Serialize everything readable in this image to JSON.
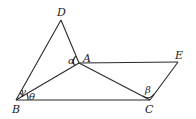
{
  "diagram": {
    "type": "geometry",
    "points": {
      "D": {
        "label": "D",
        "x": 61,
        "y": 20
      },
      "A": {
        "label": "A",
        "x": 79,
        "y": 63
      },
      "E": {
        "label": "E",
        "x": 178,
        "y": 62
      },
      "B": {
        "label": "B",
        "x": 16,
        "y": 100
      },
      "C": {
        "label": "C",
        "x": 150,
        "y": 100
      }
    },
    "segments": [
      "BD",
      "DA",
      "BA",
      "AC",
      "AE",
      "EC",
      "BC"
    ],
    "angles": {
      "alpha": {
        "label": "α",
        "vertex": "A"
      },
      "beta": {
        "label": "β",
        "vertex": "C"
      },
      "gamma": {
        "label": "γ",
        "vertex": "B"
      },
      "theta": {
        "label": "θ",
        "vertex": "B"
      }
    }
  }
}
